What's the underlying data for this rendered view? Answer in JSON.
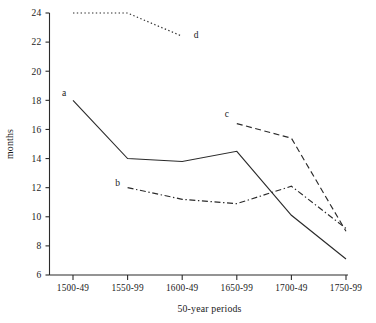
{
  "chart_data": {
    "type": "line",
    "title": "",
    "subtitle": "",
    "xlabel": "50-year periods",
    "ylabel": "months",
    "categories": [
      "1500-49",
      "1550-99",
      "1600-49",
      "1650-99",
      "1700-49",
      "1750-99"
    ],
    "ylim": [
      6,
      24
    ],
    "yticks": [
      6,
      8,
      10,
      12,
      14,
      16,
      18,
      20,
      22,
      24
    ],
    "ytick_labels": [
      "6",
      "8",
      "10",
      "12",
      "14",
      "16",
      "18",
      "20",
      "22",
      "24"
    ],
    "grid": false,
    "legend": "inline-labels",
    "legend_position": "inline next to each line",
    "series": [
      {
        "name": "a",
        "label": "a",
        "line_style": "solid",
        "color": "#2b2b2b",
        "x": [
          "1500-49",
          "1550-99",
          "1600-49",
          "1650-99",
          "1700-49",
          "1750-99"
        ],
        "values": [
          18.0,
          14.0,
          13.8,
          14.5,
          10.1,
          7.1
        ],
        "label_x": "1500-49",
        "label_y": 18.3
      },
      {
        "name": "b",
        "label": "b",
        "line_style": "dash-dot",
        "color": "#2b2b2b",
        "x": [
          "1550-99",
          "1600-49",
          "1650-99",
          "1700-49",
          "1750-99"
        ],
        "values": [
          12.0,
          11.2,
          10.9,
          12.1,
          9.2
        ],
        "label_x": "1550-99",
        "label_y": 12.2
      },
      {
        "name": "c",
        "label": "c",
        "line_style": "dashed",
        "color": "#2b2b2b",
        "x": [
          "1650-99",
          "1700-49",
          "1750-99"
        ],
        "values": [
          16.4,
          15.4,
          9.0
        ],
        "label_x": "1650-99",
        "label_y": 16.7
      },
      {
        "name": "d",
        "label": "d",
        "line_style": "dotted",
        "color": "#2b2b2b",
        "x": [
          "1500-49",
          "1550-99",
          "1600-49"
        ],
        "values": [
          24.0,
          24.0,
          22.4
        ],
        "label_x": "1600-49",
        "label_y": 22.6
      }
    ],
    "annotations": [
      {
        "text": "a",
        "series": "a"
      },
      {
        "text": "b",
        "series": "b"
      },
      {
        "text": "c",
        "series": "c"
      },
      {
        "text": "d",
        "series": "d"
      }
    ]
  },
  "axes": {
    "y_title": "months",
    "x_title": "50-year periods"
  }
}
